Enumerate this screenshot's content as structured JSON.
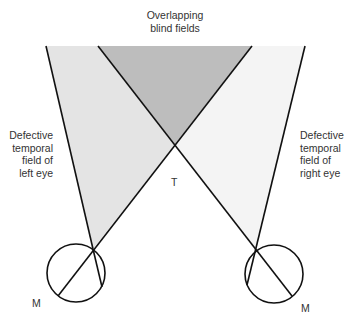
{
  "diagram": {
    "title_lines": [
      "Overlapping",
      "blind fields"
    ],
    "left_label_lines": [
      "Defective",
      "temporal",
      "field of",
      "left eye"
    ],
    "right_label_lines": [
      "Defective",
      "temporal",
      "field of",
      "right eye"
    ],
    "crossing_label": "T",
    "left_macula_label": "M",
    "right_macula_label": "M"
  },
  "colors": {
    "left_field": "#e4e4e4",
    "right_field": "#f4f4f4",
    "overlap": "#bdbdbd",
    "lines": "#111111"
  }
}
